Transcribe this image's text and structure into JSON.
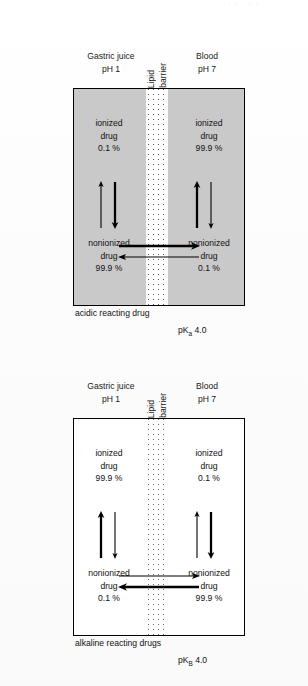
{
  "figure": {
    "top_remnant": "·· ··",
    "page_background": "#ffffff"
  },
  "panels": [
    {
      "id": "acidic",
      "box_fill": "#c9c9c9",
      "header": {
        "left_line1": "Gastric juice",
        "left_line2": "pH 1",
        "mid_line1": "Lipid",
        "mid_line2": "barrier",
        "right_line1": "Blood",
        "right_line2": "pH 7"
      },
      "compartments": {
        "top_left": {
          "line1": "ionized",
          "line2": "drug",
          "line3": "0.1 %"
        },
        "top_right": {
          "line1": "ionized",
          "line2": "drug",
          "line3": "99.9 %"
        },
        "bottom_left": {
          "line1": "nonionized",
          "line2": "drug",
          "line3": "99.9 %"
        },
        "bottom_right": {
          "line1": "nonionized",
          "line2": "drug",
          "line3": "0.1 %"
        }
      },
      "arrows": {
        "left_up_weight": "thin",
        "left_down_weight": "thick",
        "right_up_weight": "thick",
        "right_down_weight": "thin",
        "horizontal_right_weight": "thick",
        "horizontal_left_weight": "thin"
      },
      "caption": "acidic reacting drug",
      "pk_label": "pK",
      "pk_sub": "a",
      "pk_value": "4.0"
    },
    {
      "id": "alkaline",
      "box_fill": "#ffffff",
      "header": {
        "left_line1": "Gastric juice",
        "left_line2": "pH 1",
        "mid_line1": "Lipid",
        "mid_line2": "barrier",
        "right_line1": "Blood",
        "right_line2": "pH 7"
      },
      "compartments": {
        "top_left": {
          "line1": "ionized",
          "line2": "drug",
          "line3": "99.9 %"
        },
        "top_right": {
          "line1": "ionized",
          "line2": "drug",
          "line3": "0.1 %"
        },
        "bottom_left": {
          "line1": "nonionized",
          "line2": "drug",
          "line3": "0.1 %"
        },
        "bottom_right": {
          "line1": "nonionized",
          "line2": "drug",
          "line3": "99.9 %"
        }
      },
      "arrows": {
        "left_up_weight": "thick",
        "left_down_weight": "thin",
        "right_up_weight": "thin",
        "right_down_weight": "thick",
        "horizontal_right_weight": "thin",
        "horizontal_left_weight": "thick"
      },
      "caption": "alkaline reacting drugs",
      "pk_label": "pK",
      "pk_sub": "B",
      "pk_value": "4.0"
    }
  ]
}
